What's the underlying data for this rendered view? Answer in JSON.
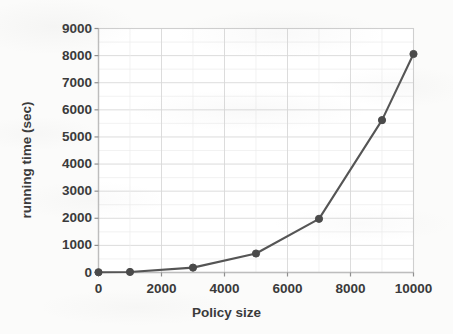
{
  "chart_data": {
    "type": "line",
    "title": "",
    "xlabel": "Policy size",
    "ylabel": "running time (sec)",
    "xlim": [
      0,
      10000
    ],
    "ylim": [
      0,
      9000
    ],
    "xticks": [
      0,
      2000,
      4000,
      6000,
      8000,
      10000
    ],
    "xtick_labels": [
      "0",
      "2000",
      "4000",
      "6000",
      "8000",
      "10000"
    ],
    "yticks": [
      0,
      1000,
      2000,
      3000,
      4000,
      5000,
      6000,
      7000,
      8000,
      9000
    ],
    "ytick_labels": [
      "0",
      "1000",
      "2000",
      "3000",
      "4000",
      "5000",
      "6000",
      "7000",
      "8000",
      "9000"
    ],
    "grid": true,
    "legend": null,
    "series": [
      {
        "name": "running time",
        "marker": "circle",
        "color": "#555555",
        "x": [
          0,
          1000,
          3000,
          5000,
          7000,
          9000,
          10000
        ],
        "values": [
          10,
          20,
          180,
          700,
          1980,
          5620,
          8060
        ]
      }
    ]
  },
  "style": {
    "line_color": "#555555",
    "marker_color": "#4a4a4a",
    "grid_color": "#d8d8d8",
    "axis_color": "#cfcfcf",
    "text_color": "#3a3a3a",
    "background": "#fbfbfa"
  }
}
